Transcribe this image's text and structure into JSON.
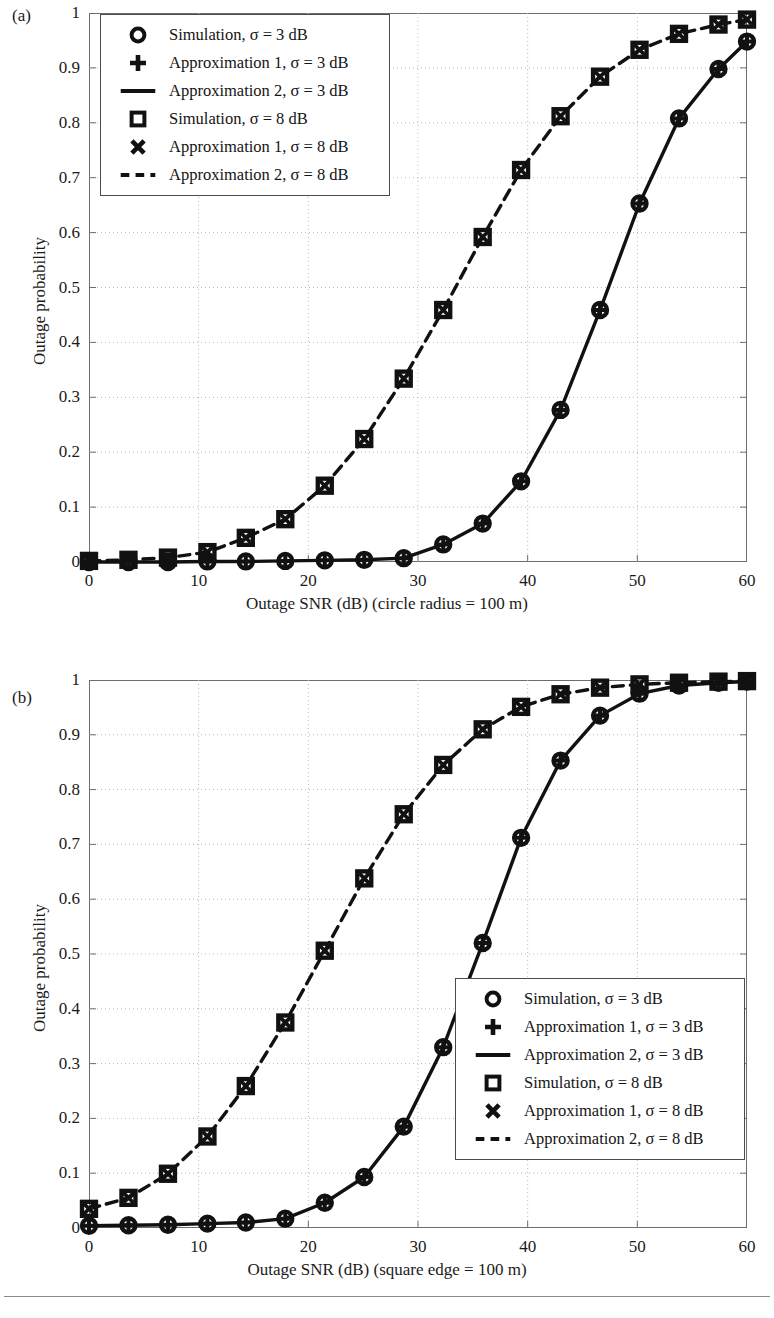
{
  "figure": {
    "panels": [
      {
        "tag": "(a)",
        "xlabel": "Outage SNR (dB) (circle radius = 100 m)",
        "ylabel": "Outage probability",
        "legend_position": "top-left"
      },
      {
        "tag": "(b)",
        "xlabel": "Outage SNR (dB) (square edge = 100 m)",
        "ylabel": "Outage probability",
        "legend_position": "bottom-right"
      }
    ],
    "legend_entries": [
      {
        "marker": "circle-open",
        "label": "Simulation, σ = 3 dB"
      },
      {
        "marker": "plus",
        "label": "Approximation 1, σ = 3 dB"
      },
      {
        "marker": "solid-line",
        "label": "Approximation 2, σ = 3 dB"
      },
      {
        "marker": "square-open",
        "label": "Simulation, σ = 8 dB"
      },
      {
        "marker": "cross",
        "label": "Approximation 1, σ = 8 dB"
      },
      {
        "marker": "dashed-line",
        "label": "Approximation 2, σ = 8 dB"
      }
    ],
    "colors": {
      "ink": "#111111",
      "axis": "#6e6e6e",
      "grid": "#b9b9b9"
    }
  },
  "chart_data": [
    {
      "type": "line",
      "panel": "(a)",
      "title": "",
      "xlabel": "Outage SNR (dB) (circle radius = 100 m)",
      "ylabel": "Outage probability",
      "xlim": [
        0,
        60
      ],
      "ylim": [
        0,
        1
      ],
      "xticks": [
        0,
        10,
        20,
        30,
        40,
        50,
        60
      ],
      "yticks": [
        0,
        0.1,
        0.2,
        0.3,
        0.4,
        0.5,
        0.6,
        0.7,
        0.8,
        0.9,
        1
      ],
      "grid": true,
      "legend": "top-left",
      "x": [
        0,
        3.6,
        7.2,
        10.8,
        14.3,
        17.9,
        21.5,
        25.1,
        28.7,
        32.3,
        35.9,
        39.4,
        43.0,
        46.6,
        50.2,
        53.8,
        57.4,
        60.0
      ],
      "series": [
        {
          "name": "Simulation, σ = 3 dB",
          "marker": "circle-open",
          "values": [
            0.0,
            0.0,
            0.0,
            0.001,
            0.001,
            0.002,
            0.003,
            0.004,
            0.007,
            0.032,
            0.07,
            0.147,
            0.277,
            0.459,
            0.653,
            0.808,
            0.898,
            0.948
          ]
        },
        {
          "name": "Approximation 1, σ = 3 dB",
          "marker": "plus",
          "values": [
            0.0,
            0.0,
            0.0,
            0.001,
            0.001,
            0.002,
            0.003,
            0.004,
            0.007,
            0.032,
            0.07,
            0.147,
            0.277,
            0.459,
            0.653,
            0.808,
            0.898,
            0.948
          ]
        },
        {
          "name": "Approximation 2, σ = 3 dB",
          "marker": "solid-line",
          "values": [
            0.0,
            0.0,
            0.0,
            0.001,
            0.001,
            0.002,
            0.003,
            0.004,
            0.007,
            0.032,
            0.07,
            0.147,
            0.277,
            0.459,
            0.653,
            0.808,
            0.898,
            0.948
          ]
        },
        {
          "name": "Simulation, σ = 8 dB",
          "marker": "square-open",
          "values": [
            0.002,
            0.004,
            0.008,
            0.018,
            0.044,
            0.078,
            0.139,
            0.224,
            0.334,
            0.459,
            0.592,
            0.714,
            0.812,
            0.884,
            0.933,
            0.962,
            0.979,
            0.988
          ]
        },
        {
          "name": "Approximation 1, σ = 8 dB",
          "marker": "cross",
          "values": [
            0.002,
            0.004,
            0.008,
            0.018,
            0.044,
            0.078,
            0.139,
            0.224,
            0.334,
            0.459,
            0.592,
            0.714,
            0.812,
            0.884,
            0.933,
            0.962,
            0.979,
            0.988
          ]
        },
        {
          "name": "Approximation 2, σ = 8 dB",
          "marker": "dashed-line",
          "values": [
            0.002,
            0.004,
            0.008,
            0.018,
            0.044,
            0.078,
            0.139,
            0.224,
            0.334,
            0.459,
            0.592,
            0.714,
            0.812,
            0.884,
            0.933,
            0.962,
            0.979,
            0.988
          ]
        }
      ]
    },
    {
      "type": "line",
      "panel": "(b)",
      "title": "",
      "xlabel": "Outage SNR (dB) (square edge = 100 m)",
      "ylabel": "Outage probability",
      "xlim": [
        0,
        60
      ],
      "ylim": [
        0,
        1
      ],
      "xticks": [
        0,
        10,
        20,
        30,
        40,
        50,
        60
      ],
      "yticks": [
        0,
        0.1,
        0.2,
        0.3,
        0.4,
        0.5,
        0.6,
        0.7,
        0.8,
        0.9,
        1
      ],
      "grid": true,
      "legend": "bottom-right",
      "x": [
        0,
        3.6,
        7.2,
        10.8,
        14.3,
        17.9,
        21.5,
        25.1,
        28.7,
        32.3,
        35.9,
        39.4,
        43.0,
        46.6,
        50.2,
        53.8,
        57.4,
        60.0
      ],
      "series": [
        {
          "name": "Simulation, σ = 3 dB",
          "marker": "circle-open",
          "values": [
            0.004,
            0.005,
            0.006,
            0.008,
            0.01,
            0.017,
            0.046,
            0.093,
            0.185,
            0.33,
            0.52,
            0.712,
            0.853,
            0.935,
            0.975,
            0.99,
            0.995,
            0.997
          ]
        },
        {
          "name": "Approximation 1, σ = 3 dB",
          "marker": "plus",
          "values": [
            0.004,
            0.005,
            0.006,
            0.008,
            0.01,
            0.017,
            0.046,
            0.093,
            0.185,
            0.33,
            0.52,
            0.712,
            0.853,
            0.935,
            0.975,
            0.99,
            0.995,
            0.997
          ]
        },
        {
          "name": "Approximation 2, σ = 3 dB",
          "marker": "solid-line",
          "values": [
            0.004,
            0.005,
            0.006,
            0.008,
            0.01,
            0.017,
            0.046,
            0.093,
            0.185,
            0.33,
            0.52,
            0.712,
            0.853,
            0.935,
            0.975,
            0.99,
            0.995,
            0.997
          ]
        },
        {
          "name": "Simulation, σ = 8 dB",
          "marker": "square-open",
          "values": [
            0.035,
            0.055,
            0.099,
            0.167,
            0.259,
            0.375,
            0.506,
            0.638,
            0.755,
            0.845,
            0.91,
            0.951,
            0.974,
            0.986,
            0.992,
            0.995,
            0.997,
            0.998
          ]
        },
        {
          "name": "Approximation 1, σ = 8 dB",
          "marker": "cross",
          "values": [
            0.035,
            0.055,
            0.099,
            0.167,
            0.259,
            0.375,
            0.506,
            0.638,
            0.755,
            0.845,
            0.91,
            0.951,
            0.974,
            0.986,
            0.992,
            0.995,
            0.997,
            0.998
          ]
        },
        {
          "name": "Approximation 2, σ = 8 dB",
          "marker": "dashed-line",
          "values": [
            0.035,
            0.055,
            0.099,
            0.167,
            0.259,
            0.375,
            0.506,
            0.638,
            0.755,
            0.845,
            0.91,
            0.951,
            0.974,
            0.986,
            0.992,
            0.995,
            0.997,
            0.998
          ]
        }
      ]
    }
  ]
}
